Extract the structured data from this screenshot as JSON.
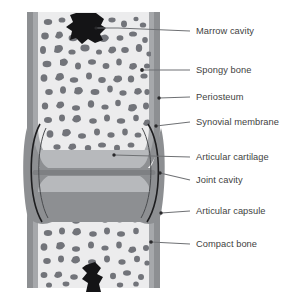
{
  "figure": {
    "background_color": "#ffffff",
    "text_color": "#3f3f42",
    "leader_color": "#6f7174"
  },
  "palette": {
    "periosteum_gray": "#8d8f92",
    "compact_bone_gray": "#a0a2a5",
    "spongy_background": "#ececed",
    "trabecula_gray": "#72747a",
    "cartilage_gray": "#b7b9bc",
    "capsule_outline": "#1d1d1f",
    "marrow_black": "#141416"
  },
  "labels": [
    {
      "id": "marrow-cavity",
      "text": "Marrow cavity",
      "text_x": 196,
      "text_y": 34,
      "line": "M 96 28 L 118 28 L 190 31",
      "anchor": {
        "x": 96,
        "y": 28,
        "r": 1.6
      }
    },
    {
      "id": "spongy-bone",
      "text": "Spongy bone",
      "text_x": 196,
      "text_y": 73,
      "line": "M 142 70 L 190 70",
      "anchor": {
        "x": 142,
        "y": 70,
        "r": 1.9
      }
    },
    {
      "id": "periosteum",
      "text": "Periosteum",
      "text_x": 196,
      "text_y": 100,
      "line": "M 159 98 L 190 97",
      "anchor": {
        "x": 159,
        "y": 98,
        "r": 1.7
      }
    },
    {
      "id": "synovial-membrane",
      "text": "Synovial membrane",
      "text_x": 196,
      "text_y": 125,
      "line": "M 156 126 L 190 122",
      "anchor": {
        "x": 156,
        "y": 126,
        "r": 1.7
      }
    },
    {
      "id": "articular-cartilage",
      "text": "Articular cartilage",
      "text_x": 196,
      "text_y": 160,
      "line": "M 114 155 L 190 157",
      "anchor": {
        "x": 114,
        "y": 155,
        "r": 1.7
      }
    },
    {
      "id": "joint-cavity",
      "text": "Joint cavity",
      "text_x": 196,
      "text_y": 183,
      "line": "M 160 173 L 190 180",
      "anchor": {
        "x": 160,
        "y": 173,
        "r": 1.7
      }
    },
    {
      "id": "articular-capsule",
      "text": "Articular capsule",
      "text_x": 196,
      "text_y": 214,
      "line": "M 161 213 L 190 211",
      "anchor": {
        "x": 161,
        "y": 213,
        "r": 1.7
      }
    },
    {
      "id": "compact-bone",
      "text": "Compact bone",
      "text_x": 196,
      "text_y": 247,
      "line": "M 151 242 L 190 244",
      "anchor": {
        "x": 151,
        "y": 242,
        "r": 1.8
      }
    }
  ]
}
